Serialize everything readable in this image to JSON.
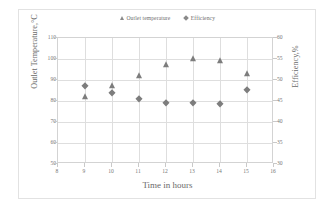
{
  "chart_data": {
    "type": "scatter",
    "title": "",
    "xlabel": "Time in hours",
    "ylabel": "Outlet Temperature,°C",
    "y2label": "Efficiency,%",
    "xlim": [
      8,
      16
    ],
    "ylim": [
      50,
      110
    ],
    "y2lim": [
      30,
      60
    ],
    "xticks": [
      8,
      9,
      10,
      11,
      12,
      13,
      14,
      15,
      16
    ],
    "yticks": [
      50,
      60,
      70,
      80,
      90,
      100,
      110
    ],
    "y2ticks": [
      30,
      35,
      40,
      45,
      50,
      55,
      60
    ],
    "grid": true,
    "legend_position": "top-center",
    "x": [
      9,
      10,
      11,
      12,
      13,
      14,
      15
    ],
    "series": [
      {
        "name": "Outlet temperature",
        "axis": "left",
        "marker": "triangle",
        "color": "#7d7d7d",
        "values": [
          82,
          87,
          92,
          97,
          100,
          99,
          93
        ]
      },
      {
        "name": "Efficiency",
        "axis": "right",
        "marker": "diamond",
        "color": "#7d7d7d",
        "values": [
          48.5,
          47.0,
          45.5,
          44.5,
          44.5,
          44.3,
          47.7
        ]
      }
    ]
  },
  "legend": {
    "items": [
      {
        "label": "Outlet temperature",
        "marker": "triangle-marker-icon"
      },
      {
        "label": "Efficiency",
        "marker": "diamond-marker-icon"
      }
    ]
  },
  "colors": {
    "marker": "#7d7d7d",
    "grid": "#dedede",
    "axis": "#d3d3d3",
    "text": "#6a6a6a",
    "frame": "#e2e2e2"
  }
}
